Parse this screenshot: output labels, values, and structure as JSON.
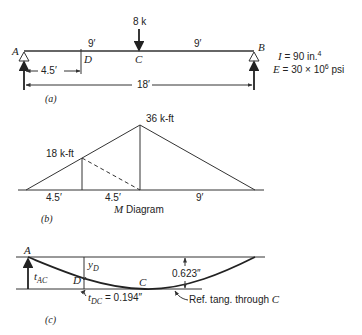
{
  "part_a": {
    "caption": "(a)",
    "points": {
      "A": "A",
      "B": "B",
      "C": "C",
      "D": "D"
    },
    "load": "8 k",
    "span_left": "9′",
    "span_right": "9′",
    "dim_AD": "4.5′",
    "dim_AB": "18′",
    "properties": {
      "I_label": "I",
      "I_value": " = 90 in.",
      "I_exp": "4",
      "E_label": "E",
      "E_value": " = 30 × 10",
      "E_exp": "6",
      "E_unit": " psi"
    }
  },
  "part_b": {
    "caption": "(b)",
    "title_M": "M",
    "title_rest": " Diagram",
    "peak_label": "36 k-ft",
    "d_label": "18 k-ft",
    "seg1": "4.5′",
    "seg2": "4.5′",
    "seg3": "9′"
  },
  "part_c": {
    "caption": "(c)",
    "A": "A",
    "C": "C",
    "D": "D",
    "y_D": "y",
    "y_D_sub": "D",
    "t_AC": "t",
    "t_AC_sub": "AC",
    "t_DC": "t",
    "t_DC_sub": "DC",
    "t_DC_value": " = 0.194″",
    "deflection_value": "0.623″",
    "ref_tangent": "Ref. tang. through ",
    "ref_tangent_point": "C"
  }
}
